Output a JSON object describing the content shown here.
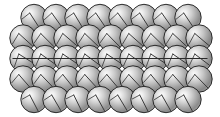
{
  "figure": {
    "name": "close-packed-sphere-lattice",
    "width": 220,
    "height": 117,
    "background_color": "#ffffff"
  },
  "sphere_style": {
    "radius": 13.2,
    "outline_color": "#1a1a1a",
    "outline_width": 0.9,
    "highlight_color": "#f2f2f2",
    "midtone_color": "#b4b4b4",
    "shadow_color": "#6e6e6e",
    "edge_color": "#8a8a8a",
    "highlight_offset_x": -0.32,
    "highlight_offset_y": -0.34,
    "vector_color": "#3a3a3a",
    "vector_width": 1.0
  },
  "plane_line": {
    "color": "#2b2b2b",
    "width": 1.0,
    "x_start": 12.5,
    "x_end": 207.5,
    "y": 58.5
  },
  "lattice": {
    "rows": [
      {
        "index": 0,
        "count": 8,
        "x_start": 34.0,
        "y": 17.5,
        "pitch": 22.0,
        "offset": "indented",
        "vector_angles": [
          62,
          58,
          65,
          60,
          57,
          63,
          59,
          61
        ]
      },
      {
        "index": 1,
        "count": 9,
        "x_start": 23.0,
        "y": 38.0,
        "pitch": 22.0,
        "offset": "flush",
        "vector_angles": [
          40,
          44,
          38,
          42,
          45,
          39,
          43,
          41,
          37
        ]
      },
      {
        "index": 2,
        "count": 9,
        "x_start": 23.0,
        "y": 58.5,
        "pitch": 22.0,
        "offset": "flush",
        "vector_angles": [
          25,
          30,
          28,
          32,
          27,
          31,
          26,
          29,
          33
        ]
      },
      {
        "index": 3,
        "count": 9,
        "x_start": 23.0,
        "y": 79.0,
        "pitch": 22.0,
        "offset": "flush",
        "vector_angles": [
          50,
          46,
          53,
          48,
          51,
          47,
          52,
          49,
          45
        ]
      },
      {
        "index": 4,
        "count": 8,
        "x_start": 34.0,
        "y": 99.5,
        "pitch": 22.0,
        "offset": "indented",
        "vector_angles": [
          70,
          66,
          72,
          68,
          65,
          71,
          67,
          69
        ]
      }
    ]
  },
  "chart_data": {
    "type": "scatter",
    "title": "",
    "xlabel": "",
    "ylabel": "",
    "xlim": [
      0,
      220
    ],
    "ylim": [
      0,
      117
    ],
    "grid": false,
    "legend": null,
    "series": [
      {
        "name": "row-1",
        "marker": "sphere",
        "x": [
          34,
          56,
          78,
          100,
          122,
          144,
          166,
          188
        ],
        "y": [
          17.5,
          17.5,
          17.5,
          17.5,
          17.5,
          17.5,
          17.5,
          17.5
        ]
      },
      {
        "name": "row-2",
        "marker": "sphere",
        "x": [
          23,
          45,
          67,
          89,
          111,
          133,
          155,
          177,
          199
        ],
        "y": [
          38,
          38,
          38,
          38,
          38,
          38,
          38,
          38,
          38
        ]
      },
      {
        "name": "row-3",
        "marker": "sphere",
        "x": [
          23,
          45,
          67,
          89,
          111,
          133,
          155,
          177,
          199
        ],
        "y": [
          58.5,
          58.5,
          58.5,
          58.5,
          58.5,
          58.5,
          58.5,
          58.5,
          58.5
        ]
      },
      {
        "name": "row-4",
        "marker": "sphere",
        "x": [
          23,
          45,
          67,
          89,
          111,
          133,
          155,
          177,
          199
        ],
        "y": [
          79,
          79,
          79,
          79,
          79,
          79,
          79,
          79,
          79
        ]
      },
      {
        "name": "row-5",
        "marker": "sphere",
        "x": [
          34,
          56,
          78,
          100,
          122,
          144,
          166,
          188
        ],
        "y": [
          99.5,
          99.5,
          99.5,
          99.5,
          99.5,
          99.5,
          99.5,
          99.5
        ]
      }
    ],
    "annotations": [
      {
        "type": "line",
        "name": "slip-plane",
        "x": [
          12.5,
          207.5
        ],
        "y": [
          58.5,
          58.5
        ]
      }
    ]
  }
}
